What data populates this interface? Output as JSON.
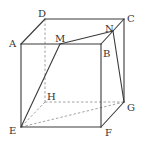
{
  "diagram": {
    "type": "cube",
    "vertices": {
      "A": [
        21,
        44
      ],
      "B": [
        101,
        44
      ],
      "C": [
        124,
        19
      ],
      "D": [
        45,
        19
      ],
      "E": [
        21,
        127
      ],
      "F": [
        101,
        127
      ],
      "G": [
        124,
        102
      ],
      "H": [
        45,
        102
      ],
      "M": [
        60,
        44
      ],
      "N": [
        113,
        31
      ]
    },
    "labels": [
      {
        "text": "D",
        "x": 38,
        "y": 17
      },
      {
        "text": "A",
        "x": 9,
        "y": 47
      },
      {
        "text": "M",
        "x": 55,
        "y": 42
      },
      {
        "text": "N",
        "x": 105,
        "y": 32
      },
      {
        "text": "C",
        "x": 127,
        "y": 22
      },
      {
        "text": "B",
        "x": 103,
        "y": 57
      },
      {
        "text": "H",
        "x": 47,
        "y": 100
      },
      {
        "text": "G",
        "x": 127,
        "y": 111
      },
      {
        "text": "E",
        "x": 9,
        "y": 134
      },
      {
        "text": "F",
        "x": 105,
        "y": 136
      }
    ],
    "solid_edges": [
      [
        "A",
        "B"
      ],
      [
        "B",
        "F"
      ],
      [
        "F",
        "E"
      ],
      [
        "E",
        "A"
      ],
      [
        "A",
        "D"
      ],
      [
        "D",
        "C"
      ],
      [
        "C",
        "B"
      ],
      [
        "C",
        "G"
      ],
      [
        "F",
        "G"
      ],
      [
        "E",
        "M"
      ],
      [
        "M",
        "N"
      ],
      [
        "N",
        "G"
      ]
    ],
    "dashed_edges": [
      [
        "D",
        "H"
      ],
      [
        "H",
        "G"
      ],
      [
        "H",
        "E"
      ],
      [
        "E",
        "G"
      ]
    ]
  }
}
